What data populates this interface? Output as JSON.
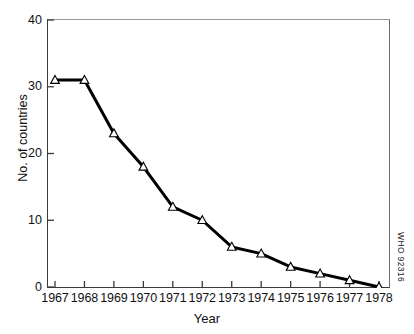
{
  "chart_data": {
    "type": "line",
    "title": "",
    "xlabel": "Year",
    "ylabel": "No. of countries",
    "categories": [
      "1967",
      "1968",
      "1969",
      "1970",
      "1971",
      "1972",
      "1973",
      "1974",
      "1975",
      "1976",
      "1977",
      "1978"
    ],
    "x": [
      1967,
      1968,
      1969,
      1970,
      1971,
      1972,
      1973,
      1974,
      1975,
      1976,
      1977,
      1978
    ],
    "values": [
      31,
      31,
      23,
      18,
      12,
      10,
      6,
      5,
      3,
      2,
      1,
      0
    ],
    "series": [
      {
        "name": "No. of countries",
        "values": [
          31,
          31,
          23,
          18,
          12,
          10,
          6,
          5,
          3,
          2,
          1,
          0
        ]
      }
    ],
    "ylim": [
      0,
      40
    ],
    "xlim": [
      1966.5,
      1978.5
    ],
    "yticks": [
      0,
      10,
      20,
      30,
      40
    ],
    "ytick_labels": [
      "0",
      "10",
      "20",
      "30",
      "40"
    ],
    "xtick_labels": [
      "1967",
      "1968",
      "1969",
      "1970",
      "1971",
      "1972",
      "1973",
      "1974",
      "1975",
      "1976",
      "1977",
      "1978"
    ],
    "grid": false,
    "legend": "none",
    "marker": "open-triangle-up",
    "marker_fill": "#ffffff",
    "line_color": "#000000",
    "line_width": 3
  },
  "annotations": {
    "who_code": "WHO 92316"
  },
  "colors": {
    "background": "#ffffff",
    "axis": "#3a3a3a",
    "text": "#111111",
    "line": "#000000",
    "marker_fill": "#ffffff"
  }
}
